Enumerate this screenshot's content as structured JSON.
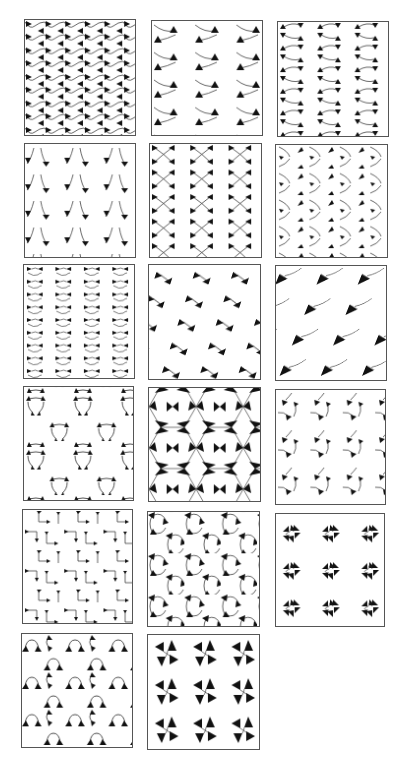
{
  "figure": {
    "layout": {
      "rows": 6,
      "columns": 3
    },
    "stroke_color": "#222222",
    "fill_color": "#111111",
    "border_color": "#555555",
    "panels": [
      {
        "id": 1,
        "name": "wavy-lines-alternating-triangles",
        "x": 24,
        "y": 19,
        "w": 112,
        "h": 117
      },
      {
        "id": 2,
        "name": "curved-arcs-single-triangles",
        "x": 151,
        "y": 20,
        "w": 112,
        "h": 116
      },
      {
        "id": 3,
        "name": "s-curve-triangle-pairs",
        "x": 277,
        "y": 21,
        "w": 112,
        "h": 116
      },
      {
        "id": 4,
        "name": "v-curves-downward-triangles",
        "x": 24,
        "y": 143,
        "w": 112,
        "h": 115
      },
      {
        "id": 5,
        "name": "crossed-curves-bowtie-columns",
        "x": 149,
        "y": 143,
        "w": 113,
        "h": 115
      },
      {
        "id": 6,
        "name": "arc-triangles-offset-columns",
        "x": 275,
        "y": 144,
        "w": 113,
        "h": 114
      },
      {
        "id": 7,
        "name": "dense-small-hooked-triangles",
        "x": 23,
        "y": 264,
        "w": 112,
        "h": 115
      },
      {
        "id": 8,
        "name": "diagonal-bowtie-triangles",
        "x": 148,
        "y": 264,
        "w": 113,
        "h": 116
      },
      {
        "id": 9,
        "name": "large-triangles-with-arcs",
        "x": 275,
        "y": 265,
        "w": 112,
        "h": 116
      },
      {
        "id": 10,
        "name": "triangular-arc-rosettes",
        "x": 23,
        "y": 386,
        "w": 111,
        "h": 115
      },
      {
        "id": 11,
        "name": "kagome-star-hexagons",
        "x": 148,
        "y": 387,
        "w": 113,
        "h": 115
      },
      {
        "id": 12,
        "name": "scattered-triangle-curves",
        "x": 275,
        "y": 389,
        "w": 111,
        "h": 116
      },
      {
        "id": 13,
        "name": "right-angle-hooks",
        "x": 22,
        "y": 509,
        "w": 111,
        "h": 115
      },
      {
        "id": 14,
        "name": "triangle-trefoil-arcs",
        "x": 147,
        "y": 511,
        "w": 113,
        "h": 116
      },
      {
        "id": 15,
        "name": "four-fold-quatrefoil-clusters",
        "x": 275,
        "y": 513,
        "w": 110,
        "h": 114
      },
      {
        "id": 16,
        "name": "arched-triangle-triplets",
        "x": 21,
        "y": 633,
        "w": 112,
        "h": 115
      },
      {
        "id": 17,
        "name": "pinwheel-triangles",
        "x": 147,
        "y": 634,
        "w": 113,
        "h": 116
      }
    ]
  }
}
